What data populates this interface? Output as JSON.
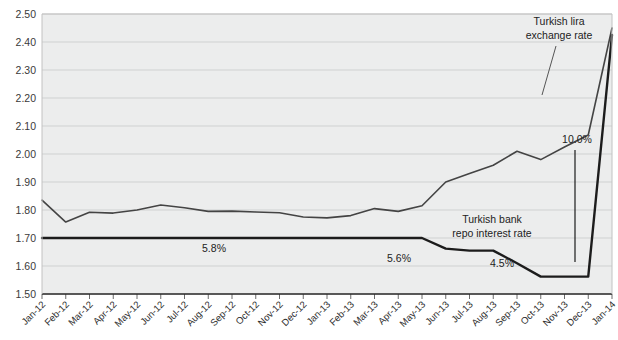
{
  "chart_data": {
    "type": "line",
    "title": "",
    "xlabel": "",
    "ylabel": "",
    "ylim": [
      1.5,
      2.5
    ],
    "ytick_step": 0.1,
    "grid": true,
    "legend": "annotations",
    "plot_background": "#eceded",
    "categories": [
      "Jan-12",
      "Feb-12",
      "Mar-12",
      "Apr-12",
      "May-12",
      "Jun-12",
      "Jul-12",
      "Aug-12",
      "Sep-12",
      "Oct-12",
      "Nov-12",
      "Dec-12",
      "Jan-13",
      "Feb-13",
      "Mar-13",
      "Apr-13",
      "May-13",
      "Jun-13",
      "Jul-13",
      "Aug-13",
      "Sep-13",
      "Oct-13",
      "Nov-13",
      "Dec-13",
      "Jan-14"
    ],
    "yticks": [
      "1.50",
      "1.60",
      "1.70",
      "1.80",
      "1.90",
      "2.00",
      "2.10",
      "2.20",
      "2.30",
      "2.40",
      "2.50"
    ],
    "series": [
      {
        "name": "Turkish lira exchange rate",
        "color": "#444444",
        "width": 1.6,
        "values": [
          1.835,
          1.757,
          1.792,
          1.789,
          1.8,
          1.818,
          1.808,
          1.795,
          1.796,
          1.793,
          1.79,
          1.775,
          1.772,
          1.78,
          1.805,
          1.795,
          1.815,
          1.9,
          1.93,
          1.96,
          2.01,
          1.98,
          2.025,
          2.068,
          2.45
        ]
      },
      {
        "name": "Turkish bank repo interest rate",
        "color": "#1c1c1c",
        "width": 2.4,
        "values": [
          1.7,
          1.7,
          1.7,
          1.7,
          1.7,
          1.7,
          1.7,
          1.7,
          1.7,
          1.7,
          1.7,
          1.7,
          1.7,
          1.7,
          1.7,
          1.7,
          1.7,
          1.662,
          1.655,
          1.655,
          1.61,
          1.562,
          1.562,
          1.562,
          2.425
        ]
      }
    ],
    "annotations": [
      {
        "name": "lira-label",
        "text": "Turkish lira",
        "x": 559,
        "y": 25,
        "anchor": "middle"
      },
      {
        "name": "lira-label-2",
        "text": "exchange rate",
        "x": 559,
        "y": 39,
        "anchor": "middle"
      },
      {
        "name": "repo-label",
        "text": "Turkish bank",
        "x": 492,
        "y": 223,
        "anchor": "middle"
      },
      {
        "name": "repo-label-2",
        "text": "repo interest rate",
        "x": 492,
        "y": 237,
        "anchor": "middle"
      }
    ],
    "data_labels": [
      {
        "name": "datalabel-5-8",
        "text": "5.8%",
        "x": 214,
        "y": 252
      },
      {
        "name": "datalabel-5-6",
        "text": "5.6%",
        "x": 399,
        "y": 262
      },
      {
        "name": "datalabel-4-5",
        "text": "4.5%",
        "x": 502,
        "y": 267
      },
      {
        "name": "datalabel-10-0",
        "text": "10.0%",
        "x": 577,
        "y": 143
      }
    ]
  }
}
